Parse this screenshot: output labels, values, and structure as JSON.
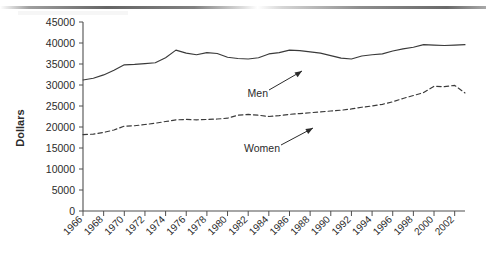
{
  "chart_data": {
    "type": "line",
    "title": "",
    "xlabel": "",
    "ylabel": "Dollars",
    "ylim": [
      0,
      45000
    ],
    "ytick_labels": [
      "0",
      "5000",
      "10000",
      "15000",
      "20000",
      "25000",
      "30000",
      "35000",
      "40000",
      "45000"
    ],
    "yticks": [
      0,
      5000,
      10000,
      15000,
      20000,
      25000,
      30000,
      35000,
      40000,
      45000
    ],
    "grid": false,
    "legend_position": "inline-annotations",
    "x": [
      1966,
      1967,
      1968,
      1969,
      1970,
      1971,
      1972,
      1973,
      1974,
      1975,
      1976,
      1977,
      1978,
      1979,
      1980,
      1981,
      1982,
      1983,
      1984,
      1985,
      1986,
      1987,
      1988,
      1989,
      1990,
      1991,
      1992,
      1993,
      1994,
      1995,
      1996,
      1997,
      1998,
      1999,
      2000,
      2001,
      2002,
      2003
    ],
    "xtick_labels": [
      "1966",
      "1968",
      "1970",
      "1972",
      "1974",
      "1976",
      "1978",
      "1980",
      "1982",
      "1984",
      "1986",
      "1988",
      "1990",
      "1992",
      "1994",
      "1996",
      "1998",
      "2000",
      "2002"
    ],
    "series": [
      {
        "name": "Men",
        "style": "solid",
        "color": "#3a3a3a",
        "values": [
          31200,
          31600,
          32400,
          33500,
          34800,
          34900,
          35100,
          35300,
          36500,
          38300,
          37600,
          37200,
          37700,
          37500,
          36600,
          36300,
          36200,
          36500,
          37400,
          37700,
          38300,
          38200,
          37900,
          37600,
          37000,
          36400,
          36200,
          36900,
          37200,
          37400,
          38100,
          38600,
          39000,
          39600,
          39500,
          39400,
          39500,
          39600
        ]
      },
      {
        "name": "Women",
        "style": "dashed",
        "color": "#3a3a3a",
        "values": [
          18200,
          18300,
          18700,
          19300,
          20200,
          20300,
          20600,
          20900,
          21300,
          21700,
          21800,
          21700,
          21800,
          21900,
          22100,
          22800,
          23000,
          22800,
          22500,
          22700,
          23000,
          23200,
          23400,
          23600,
          23800,
          24000,
          24300,
          24700,
          25000,
          25400,
          26000,
          26800,
          27500,
          28200,
          29700,
          29600,
          29900,
          28100
        ]
      }
    ],
    "annotations": [
      {
        "label": "Men",
        "series": "Men"
      },
      {
        "label": "Women",
        "series": "Women"
      }
    ]
  }
}
